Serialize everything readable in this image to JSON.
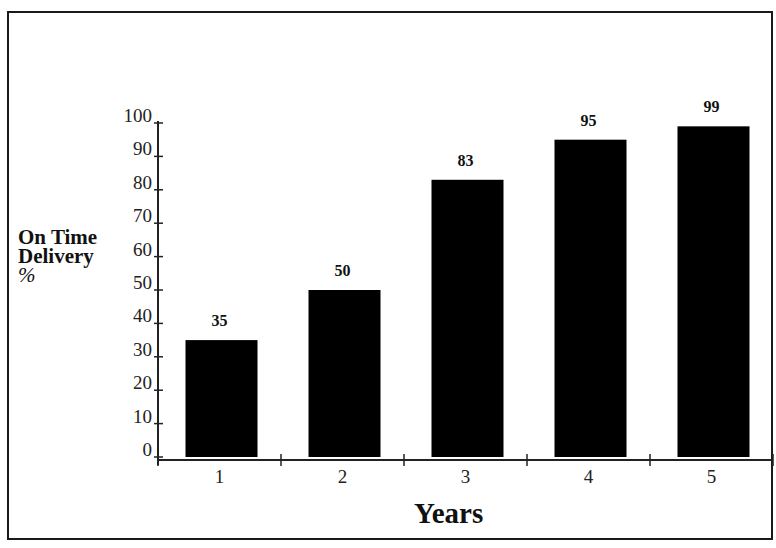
{
  "chart_data": {
    "type": "bar",
    "title": "",
    "xlabel": "Years",
    "ylabel": "On Time Delivery %",
    "ylabel_lines": [
      "On Time",
      "Delivery",
      "%"
    ],
    "categories": [
      "1",
      "2",
      "3",
      "4",
      "5"
    ],
    "values": [
      35,
      50,
      83,
      95,
      99
    ],
    "value_labels": [
      "35",
      "50",
      "83",
      "95",
      "99"
    ],
    "yticks": [
      0,
      10,
      20,
      30,
      40,
      50,
      60,
      70,
      80,
      90,
      100
    ],
    "ylim": [
      0,
      100
    ],
    "grid": false,
    "legend": null,
    "bar_color": "#000000"
  }
}
